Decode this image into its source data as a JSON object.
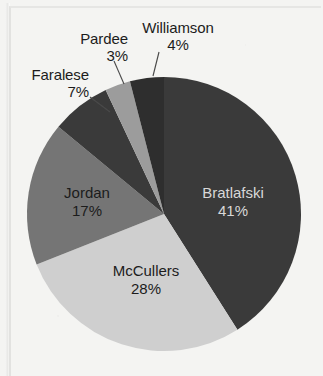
{
  "chart_data": {
    "type": "pie",
    "title": "",
    "subtitle": "",
    "xlabel": "",
    "ylabel": "",
    "legend_position": "none",
    "grid": false,
    "value_unit": "percent",
    "start_angle_deg": 0,
    "direction": "clockwise",
    "categories": [
      "Bratlafski",
      "McCullers",
      "Jordan",
      "Faralese",
      "Pardee",
      "Williamson"
    ],
    "values": [
      41,
      28,
      17,
      7,
      3,
      4
    ],
    "slices": [
      {
        "name": "Bratlafski",
        "value": 41,
        "percent_text": "41%",
        "color": "#3a3a3a",
        "label_placement": "inside",
        "text_color": "#d8d8d8",
        "leader_line": false
      },
      {
        "name": "McCullers",
        "value": 28,
        "percent_text": "28%",
        "color": "#cfcfcf",
        "label_placement": "inside",
        "text_color": "#1c1c1c",
        "leader_line": false
      },
      {
        "name": "Jordan",
        "value": 17,
        "percent_text": "17%",
        "color": "#757575",
        "label_placement": "inside",
        "text_color": "#1c1c1c",
        "leader_line": false
      },
      {
        "name": "Faralese",
        "value": 7,
        "percent_text": "7%",
        "color": "#3a3a3a",
        "label_placement": "outside",
        "text_color": "#1c1c1c",
        "leader_line": true
      },
      {
        "name": "Pardee",
        "value": 3,
        "percent_text": "3%",
        "color": "#9c9c9c",
        "label_placement": "outside",
        "text_color": "#1c1c1c",
        "leader_line": true
      },
      {
        "name": "Williamson",
        "value": 4,
        "percent_text": "4%",
        "color": "#2e2e2e",
        "label_placement": "outside",
        "text_color": "#1c1c1c",
        "leader_line": true
      }
    ]
  },
  "labels": {
    "bratlafski": {
      "name": "Bratlafski",
      "percent": "41%"
    },
    "mccullers": {
      "name": "McCullers",
      "percent": "28%"
    },
    "jordan": {
      "name": "Jordan",
      "percent": "17%"
    },
    "faralese": {
      "name": "Faralese",
      "percent": "7%"
    },
    "pardee": {
      "name": "Pardee",
      "percent": "3%"
    },
    "williamson": {
      "name": "Williamson",
      "percent": "4%"
    }
  },
  "colors": {
    "background": "#f4f4f2",
    "dark_slice": "#3a3a3a",
    "mid_slice": "#757575",
    "light_mid_slice": "#9c9c9c",
    "light_slice": "#cfcfcf",
    "label_text": "#1c1c1c",
    "inverse_label_text": "#d8d8d8",
    "leader_line": "#4a4a4a"
  }
}
